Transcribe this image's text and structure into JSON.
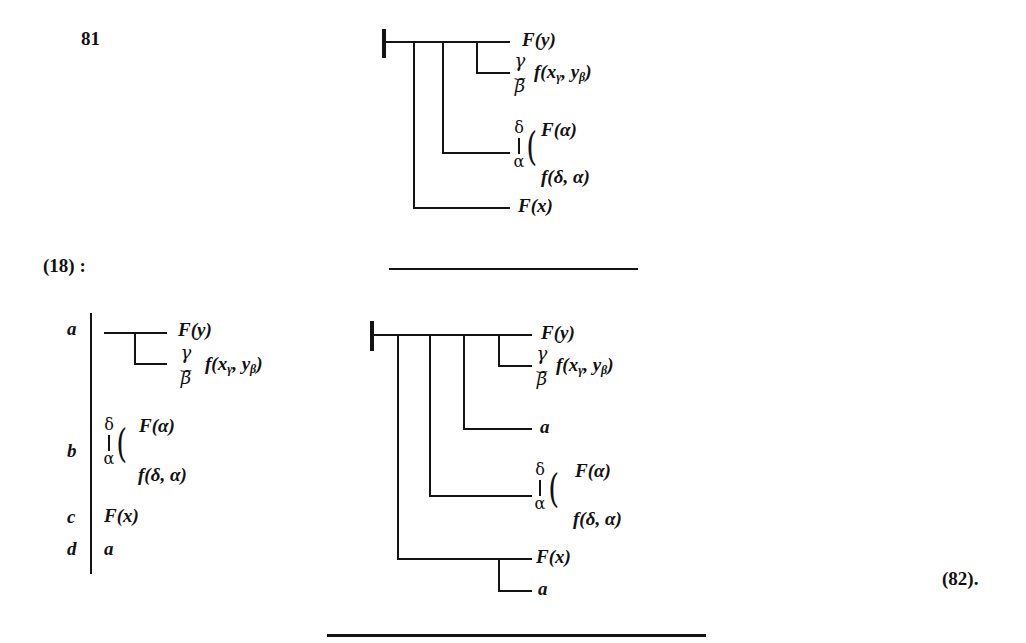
{
  "page": {
    "number_label": "81",
    "equation_ref": "(18) :",
    "result_ref": "(82)."
  },
  "top_diagram": {
    "rows": {
      "F_y": "F(y)",
      "f_xy": "f(x",
      "f_xy_sub1": "γ",
      "f_xy_mid": ", y",
      "f_xy_sub2": "β",
      "f_xy_end": ")",
      "concavity_top": "γ",
      "concavity_bottom": "β",
      "concavity_mark": "‿",
      "quant_top": "δ",
      "quant_bottom": "α",
      "F_alpha": "F(α)",
      "f_delta_alpha": "f(δ, α)",
      "F_x": "F(x)"
    }
  },
  "premises": {
    "labels": [
      "a",
      "b",
      "c",
      "d"
    ],
    "a": {
      "F_y": "F(y)",
      "f_xy": "f(x",
      "f_xy_sub1": "γ",
      "f_xy_mid": ", y",
      "f_xy_sub2": "β",
      "f_xy_end": ")",
      "concavity_top": "γ",
      "concavity_bottom": "β",
      "concavity_mark": "‿"
    },
    "b": {
      "quant_top": "δ",
      "quant_bottom": "α",
      "F_alpha": "F(α)",
      "f_delta_alpha": "f(δ, α)"
    },
    "c": {
      "F_x": "F(x)"
    },
    "d": {
      "a": "a"
    }
  },
  "bottom_diagram": {
    "rows": {
      "F_y": "F(y)",
      "f_xy": "f(x",
      "f_xy_sub1": "γ",
      "f_xy_mid": ", y",
      "f_xy_sub2": "β",
      "f_xy_end": ")",
      "concavity_top": "γ",
      "concavity_bottom": "β",
      "concavity_mark": "‿",
      "a1": "a",
      "quant_top": "δ",
      "quant_bottom": "α",
      "F_alpha": "F(α)",
      "f_delta_alpha": "f(δ, α)",
      "F_x": "F(x)",
      "a2": "a"
    }
  }
}
